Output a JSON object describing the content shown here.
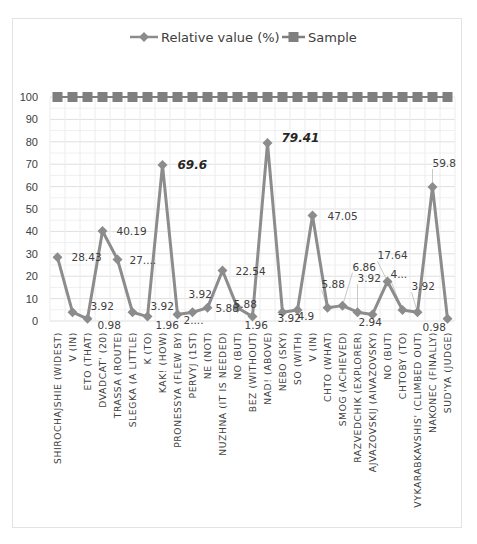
{
  "chart_data": {
    "type": "line",
    "title": "",
    "xlabel": "",
    "ylabel": "",
    "ylim": [
      0,
      100
    ],
    "yticks": [
      0,
      10,
      20,
      30,
      40,
      50,
      60,
      70,
      80,
      90,
      100
    ],
    "grid": true,
    "legend_position": "top",
    "categories": [
      "SHIROCHAJSHIE (WIDEST)",
      "V (IN)",
      "ETO (THAT)",
      "DVADCAT' (20)",
      "TRASSA (ROUTE)",
      "SLEGKA (A LITTLE)",
      "K (TO)",
      "KAK! (HOW)",
      "PRONESSYA (FLEW BY)",
      "PERVYJ (1ST)",
      "NE (NOT)",
      "NUZHNA (IT IS NEEDED)",
      "NO (BUT)",
      "BEZ (WITHOUT)",
      "NAD! (ABOVE)",
      "NEBO (SKY)",
      "SO (WITH)",
      "V (IN)",
      "CHTO (WHAT)",
      "SMOG (ACHIEVED)",
      "RAZVEDCHIK (EXPLORER)",
      "AJVAZOVSKIJ (AIVAZOVSKY)",
      "NO (BUT)",
      "CHTOBY (TO)",
      "VYKARABKAVSHIS' (CLIMBED OUT)",
      "NAKONEC (FINALLY)",
      "SUD'YA (JUDGE)"
    ],
    "series": [
      {
        "name": "Relative value (%)",
        "color": "#8c8c8c",
        "marker": "diamond",
        "values": [
          28.43,
          3.92,
          0.98,
          40.19,
          27.45,
          3.92,
          1.96,
          69.6,
          2.94,
          3.92,
          5.88,
          22.54,
          5.88,
          1.96,
          79.41,
          3.92,
          4.9,
          47.05,
          5.88,
          6.86,
          3.92,
          2.94,
          17.64,
          4.9,
          3.92,
          59.8,
          0.98
        ],
        "labels": [
          "28.43",
          "3.92",
          "0.98",
          "40.19",
          "27....",
          "3.92",
          "1.96",
          "69.6",
          "2....",
          "3.92",
          "5.88",
          "22.54",
          "5.88",
          "1.96",
          "79.41",
          "3.92",
          "4.9",
          "47.05",
          "5.88",
          "6.86",
          "3.92",
          "2.94",
          "17.64",
          "4...",
          "3.92",
          "59.8",
          "0.98"
        ]
      },
      {
        "name": "Sample",
        "color": "#7f7f7f",
        "marker": "square",
        "values": [
          100,
          100,
          100,
          100,
          100,
          100,
          100,
          100,
          100,
          100,
          100,
          100,
          100,
          100,
          100,
          100,
          100,
          100,
          100,
          100,
          100,
          100,
          100,
          100,
          100,
          100,
          100
        ]
      }
    ],
    "annotations": [
      {
        "text": "69.6",
        "style": "bold-italic"
      },
      {
        "text": "79.41",
        "style": "bold-italic"
      }
    ]
  },
  "legend": {
    "series1": "Relative value (%)",
    "series2": "Sample"
  }
}
